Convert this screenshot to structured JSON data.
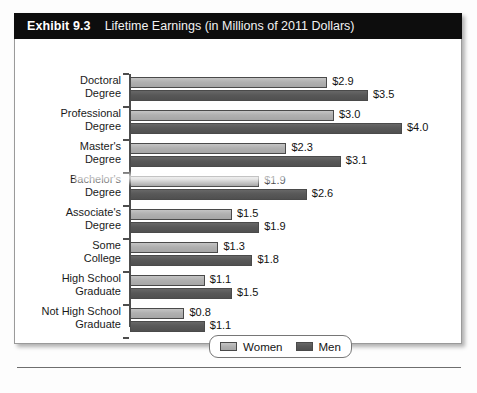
{
  "exhibit": {
    "number": "Exhibit 9.3",
    "title": "Lifetime Earnings (in Millions of 2011 Dollars)"
  },
  "legend": {
    "women_label": "Women",
    "men_label": "Men"
  },
  "colors": {
    "women_bar": "#b0b0b0",
    "men_bar": "#585858",
    "header_background": "#0d0d0d",
    "header_text": "#ffffff",
    "axis": "#4d4d4d",
    "panel_border": "#9a9a9a"
  },
  "chart_data": {
    "type": "bar",
    "orientation": "horizontal",
    "title": "Lifetime Earnings (in Millions of 2011 Dollars)",
    "xlabel": "",
    "ylabel": "",
    "xlim": [
      0,
      4.0
    ],
    "grid": false,
    "legend_position": "bottom",
    "categories": [
      "Doctoral Degree",
      "Professional Degree",
      "Master's Degree",
      "Bachelor's Degree",
      "Associate's Degree",
      "Some College",
      "High School Graduate",
      "Not High School Graduate"
    ],
    "category_lines": [
      [
        "Doctoral",
        "Degree"
      ],
      [
        "Professional",
        "Degree"
      ],
      [
        "Master's",
        "Degree"
      ],
      [
        "Bachelor's",
        "Degree"
      ],
      [
        "Associate's",
        "Degree"
      ],
      [
        "Some",
        "College"
      ],
      [
        "High School",
        "Graduate"
      ],
      [
        "Not High School",
        "Graduate"
      ]
    ],
    "series": [
      {
        "name": "Women",
        "values": [
          2.9,
          3.0,
          2.3,
          1.9,
          1.5,
          1.3,
          1.1,
          0.8
        ],
        "labels": [
          "$2.9",
          "$3.0",
          "$2.3",
          "$1.9",
          "$1.5",
          "$1.3",
          "$1.1",
          "$0.8"
        ]
      },
      {
        "name": "Men",
        "values": [
          3.5,
          4.0,
          3.1,
          2.6,
          1.9,
          1.8,
          1.5,
          1.1
        ],
        "labels": [
          "$3.5",
          "$4.0",
          "$3.1",
          "$2.6",
          "$1.9",
          "$1.8",
          "$1.5",
          "$1.1"
        ]
      }
    ]
  }
}
